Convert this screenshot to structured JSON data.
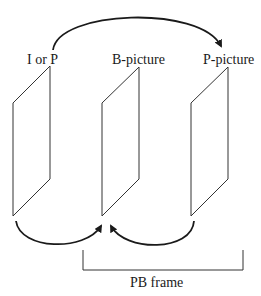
{
  "labels": {
    "frame1": "I or P",
    "frame2": "B-picture",
    "frame3": "P-picture",
    "group": "PB frame"
  },
  "colors": {
    "line": "#1a1a1a",
    "background": "#ffffff"
  }
}
